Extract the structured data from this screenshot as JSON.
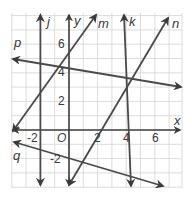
{
  "figure": {
    "type": "coordinate-plane",
    "grid": {
      "xmin": -4,
      "xmax": 8,
      "ymin": -4,
      "ymax": 8,
      "step": 1,
      "color": "#d0d0d0"
    },
    "axes": {
      "x_label": "x",
      "y_label": "y",
      "origin_label": "O",
      "x_ticks": [
        "-2",
        "2",
        "4",
        "6"
      ],
      "y_ticks": [
        "6",
        "4",
        "2",
        "-2"
      ]
    },
    "lines": [
      {
        "name": "j",
        "label": "j",
        "description": "vertical line at x = -2"
      },
      {
        "name": "k",
        "label": "k",
        "description": "steep line with negative slope near x = 4"
      },
      {
        "name": "m",
        "label": "m",
        "description": "line with positive slope through (0, 5)"
      },
      {
        "name": "n",
        "label": "n",
        "description": "line with positive slope through y-axis near -3"
      },
      {
        "name": "p",
        "label": "p",
        "description": "line with negative slope through y-axis near 5.5"
      },
      {
        "name": "q",
        "label": "q",
        "description": "line with negative slope below x-axis"
      }
    ],
    "line_color": "#4a4a4a",
    "axis_color": "#3a3a3a"
  }
}
